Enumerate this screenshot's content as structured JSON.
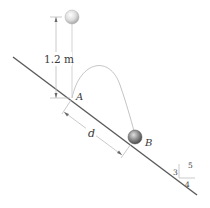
{
  "diagram": {
    "height_label": "1.2 m",
    "point_a_label": "A",
    "point_b_label": "B",
    "distance_label": "d",
    "slope_triangle": {
      "rise": "3",
      "run": "4",
      "hypotenuse": "5"
    },
    "colors": {
      "incline": "#5a5a5a",
      "dimension": "#bdbdbd",
      "trajectory": "#c4c4c4",
      "ball_top": "#d8d8d8",
      "ball_b": "#8a8a8a"
    }
  }
}
